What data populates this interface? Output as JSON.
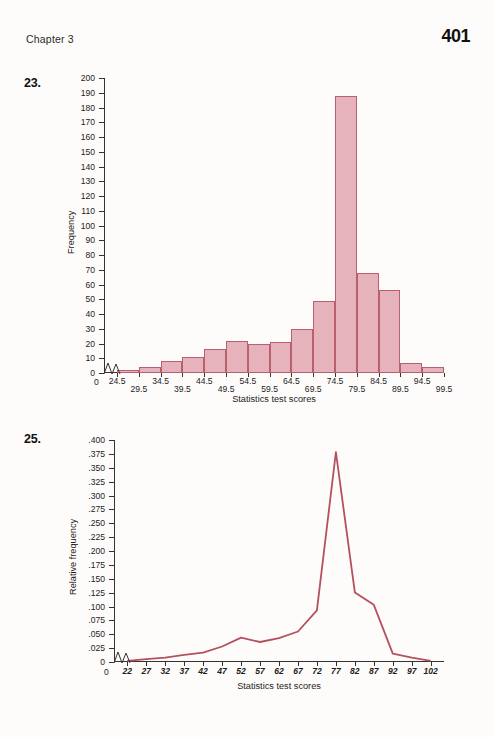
{
  "header": {
    "running_head": "Chapter 3",
    "page_number": "401"
  },
  "problems": [
    {
      "number": "23."
    },
    {
      "number": "25."
    }
  ],
  "chart_data": [
    {
      "type": "bar",
      "problem": "23.",
      "title": "",
      "xlabel": "Statistics test scores",
      "ylabel": "Frequency",
      "categories": [
        "24.5",
        "29.5",
        "34.5",
        "39.5",
        "44.5",
        "49.5",
        "54.5",
        "59.5",
        "64.5",
        "69.5",
        "74.5",
        "79.5",
        "84.5",
        "89.5",
        "94.5",
        "99.5"
      ],
      "values": [
        2,
        4,
        8,
        11,
        16,
        22,
        20,
        21,
        30,
        49,
        188,
        68,
        56,
        7,
        4
      ],
      "ylim": [
        0,
        200
      ],
      "ytick_labels": [
        "0",
        "10",
        "20",
        "30",
        "40",
        "50",
        "60",
        "70",
        "80",
        "90",
        "100",
        "110",
        "120",
        "130",
        "140",
        "150",
        "160",
        "170",
        "180",
        "190",
        "200"
      ],
      "ytick_step": 10,
      "grid": false,
      "legend": "none",
      "axis_break": true,
      "bar_fill": "#e6b3bd",
      "bar_stroke": "#b9606f"
    },
    {
      "type": "line",
      "problem": "25.",
      "title": "",
      "xlabel": "Statistics test scores",
      "ylabel": "Relative frequency",
      "x": [
        "22",
        "27",
        "32",
        "37",
        "42",
        "47",
        "52",
        "57",
        "62",
        "67",
        "72",
        "77",
        "82",
        "87",
        "92",
        "97",
        "102"
      ],
      "values": [
        0.002,
        0.005,
        0.008,
        0.013,
        0.017,
        0.028,
        0.044,
        0.036,
        0.043,
        0.055,
        0.093,
        0.378,
        0.125,
        0.103,
        0.015,
        0.008,
        0.002
      ],
      "ylim": [
        0,
        0.4
      ],
      "ytick_labels": [
        "0",
        ".025",
        ".050",
        ".075",
        ".100",
        ".125",
        ".150",
        ".175",
        ".200",
        ".225",
        ".250",
        ".275",
        ".300",
        ".325",
        ".350",
        ".375",
        ".400"
      ],
      "ytick_step": 0.025,
      "grid": false,
      "legend": "none",
      "axis_break": true,
      "line_color": "#b5505e"
    }
  ]
}
